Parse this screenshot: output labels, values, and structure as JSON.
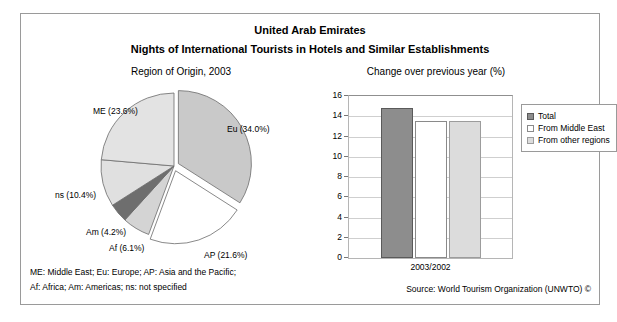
{
  "header": {
    "country": "United Arab Emirates",
    "subject": "Nights of International Tourists in Hotels and Similar Establishments"
  },
  "footer": {
    "note_line1": "ME: Middle East; Eu: Europe; AP: Asia and the Pacific;",
    "note_line2": "Af: Africa; Am: Americas; ns: not specified",
    "source": "Source: World Tourism Organization (UNWTO) ©"
  },
  "chart_data": [
    {
      "type": "pie",
      "title": "Region of Origin, 2003",
      "labels": [
        "Eu (34.0%)",
        "AP (21.6%)",
        "Af (6.1%)",
        "Am (4.2%)",
        "ns (10.4%)",
        "ME (23.6%)"
      ],
      "categories": [
        "Eu",
        "AP",
        "Af",
        "Am",
        "ns",
        "ME"
      ],
      "values": [
        34.0,
        21.6,
        6.1,
        4.2,
        10.4,
        23.6
      ],
      "colors": [
        "#c9c9c9",
        "#ffffff",
        "#d4d4d4",
        "#6e6e6e",
        "#e0e0e0",
        "#e3e3e3"
      ],
      "exploded": [
        "Eu",
        "AP"
      ],
      "legend": "none"
    },
    {
      "type": "bar",
      "title": "Change over previous year (%)",
      "categories": [
        "2003/2002"
      ],
      "xlabel": "2003/2002",
      "ylabel": "",
      "ylim": [
        0,
        16
      ],
      "yticks": [
        "0",
        "2",
        "4",
        "6",
        "8",
        "10",
        "12",
        "14",
        "16"
      ],
      "grid": true,
      "legend_position": "right",
      "series": [
        {
          "name": "Total",
          "values": [
            14.8
          ],
          "color": "#8d8d8d"
        },
        {
          "name": "From Middle East",
          "values": [
            13.5
          ],
          "color": "#ffffff"
        },
        {
          "name": "From other regions",
          "values": [
            13.5
          ],
          "color": "#dcdcdc"
        }
      ]
    }
  ]
}
